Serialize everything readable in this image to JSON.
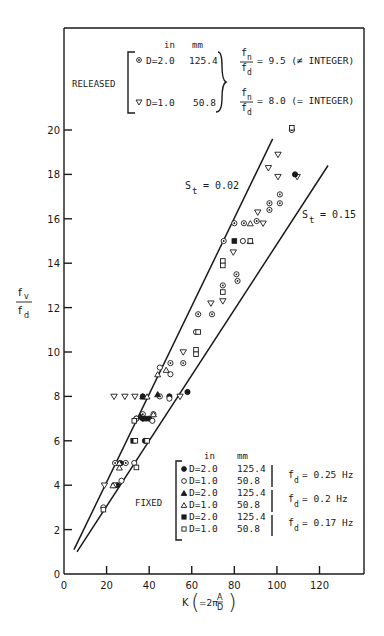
{
  "chart_data": {
    "type": "scatter",
    "title": "",
    "xlabel": "K (=2πA/D)",
    "ylabel": "f_v / f_d",
    "xlim": [
      0,
      141
    ],
    "ylim": [
      0,
      20.9
    ],
    "xticks": [
      0,
      20,
      40,
      60,
      80,
      100,
      120
    ],
    "yticks": [
      0,
      2,
      4,
      6,
      8,
      10,
      12,
      14,
      16,
      18,
      20
    ],
    "grid": false,
    "lines": [
      {
        "name": "St = 0.02",
        "label": "S_t = 0.02",
        "x": [
          4.7,
          98
        ],
        "y": [
          1.1,
          19.6
        ]
      },
      {
        "name": "St = 0.15",
        "label": "S_t = 0.15",
        "x": [
          6.1,
          124
        ],
        "y": [
          1.0,
          18.4
        ]
      }
    ],
    "series": [
      {
        "name": "Released D=2.0 in (125.4 mm), fn/fd=9.5",
        "marker": "circle-dot",
        "points": [
          [
            107,
            20
          ],
          [
            101.4,
            17.1
          ],
          [
            96.5,
            16.7
          ],
          [
            96.5,
            16.4
          ],
          [
            101.4,
            16.7
          ],
          [
            80,
            15.8
          ],
          [
            84.5,
            15.8
          ],
          [
            90.5,
            15.9
          ],
          [
            75,
            15
          ],
          [
            81,
            13.5
          ],
          [
            81.5,
            13.2
          ],
          [
            74.6,
            13
          ],
          [
            63,
            11.7
          ],
          [
            69.5,
            11.7
          ],
          [
            50,
            9.5
          ],
          [
            56,
            9.5
          ],
          [
            24,
            5
          ],
          [
            29,
            5
          ],
          [
            34,
            7
          ],
          [
            37,
            7.2
          ],
          [
            42,
            7.2
          ]
        ]
      },
      {
        "name": "Released D=1.0 in (50.8 mm), fn/fd=8.0",
        "marker": "triangle-down",
        "points": [
          [
            100.5,
            18.9
          ],
          [
            96,
            18.3
          ],
          [
            100.5,
            17.9
          ],
          [
            109.5,
            17.9
          ],
          [
            91,
            16.3
          ],
          [
            93.5,
            15.8
          ],
          [
            79.5,
            14.5
          ],
          [
            69,
            12.2
          ],
          [
            74.6,
            12.3
          ],
          [
            56,
            10
          ],
          [
            54.5,
            8
          ],
          [
            23.5,
            8
          ],
          [
            28.6,
            8
          ],
          [
            33.3,
            8
          ],
          [
            19,
            4
          ]
        ]
      },
      {
        "name": "Fixed D=2.0 in, fd=0.25 Hz",
        "marker": "circle-filled",
        "points": [
          [
            108.5,
            18
          ],
          [
            58,
            8.2
          ],
          [
            49.5,
            8
          ],
          [
            37,
            8
          ],
          [
            37,
            7
          ],
          [
            38,
            6
          ],
          [
            25,
            4
          ],
          [
            26.5,
            5
          ],
          [
            40,
            7
          ]
        ]
      },
      {
        "name": "Fixed D=1.0 in, fd=0.25 Hz",
        "marker": "circle-open",
        "points": [
          [
            84,
            15
          ],
          [
            62,
            10.9
          ],
          [
            50,
            9
          ],
          [
            45,
            9.3
          ],
          [
            45,
            8
          ],
          [
            49.5,
            7.9
          ],
          [
            34,
            7
          ],
          [
            41.5,
            6.9
          ],
          [
            33,
            5
          ],
          [
            23.5,
            4
          ],
          [
            27,
            4.2
          ],
          [
            18.5,
            3
          ]
        ]
      },
      {
        "name": "Fixed D=2.0 in, fd=0.2 Hz",
        "marker": "triangle-filled",
        "points": [
          [
            37,
            8
          ],
          [
            44,
            8.1
          ],
          [
            36,
            7.1
          ]
        ]
      },
      {
        "name": "Fixed D=1.0 in, fd=0.2 Hz",
        "marker": "triangle-open",
        "points": [
          [
            87.5,
            15.8
          ],
          [
            87.5,
            15
          ],
          [
            44,
            9
          ],
          [
            48,
            9.2
          ],
          [
            39,
            8
          ],
          [
            42,
            7.2
          ],
          [
            26,
            5
          ],
          [
            26,
            4.8
          ],
          [
            23,
            4
          ]
        ]
      },
      {
        "name": "Fixed D=2.0 in, fd=0.17 Hz",
        "marker": "square-filled",
        "points": [
          [
            80,
            15
          ],
          [
            32.5,
            6
          ],
          [
            38,
            7
          ]
        ]
      },
      {
        "name": "Fixed D=1.0 in, fd=0.17 Hz",
        "marker": "square-open",
        "points": [
          [
            107,
            20.1
          ],
          [
            87.5,
            15
          ],
          [
            74.6,
            14.1
          ],
          [
            74.6,
            13.9
          ],
          [
            74.6,
            12.7
          ],
          [
            63,
            10.9
          ],
          [
            62,
            10.1
          ],
          [
            62,
            9.9
          ],
          [
            33,
            6.9
          ],
          [
            39,
            6
          ],
          [
            33.5,
            6
          ],
          [
            34,
            4.8
          ],
          [
            18.5,
            2.9
          ]
        ]
      }
    ],
    "annotations": [
      "S_t = 0.02",
      "S_t = 0.15",
      "RELEASED",
      "FIXED"
    ]
  },
  "axes": {
    "xlabel_prefix": "K",
    "xlabel_eq": "=2π",
    "xlabel_num": "A",
    "xlabel_den": "D",
    "ylabel_num": "f",
    "ylabel_num_sub": "v",
    "ylabel_den": "f",
    "ylabel_den_sub": "d",
    "xtick_labels": [
      "0",
      "20",
      "40",
      "60",
      "80",
      "100",
      "120"
    ],
    "ytick_labels": [
      "0",
      "2",
      "4",
      "6",
      "8",
      "10",
      "12",
      "14",
      "16",
      "18",
      "20"
    ]
  },
  "lines_labels": {
    "st002_s": "S",
    "st002_sub": "t",
    "st002_val": "= 0.02",
    "st015_s": "S",
    "st015_sub": "t",
    "st015_val": "= 0.15"
  },
  "legend_released": {
    "title": "RELEASED",
    "col_in": "in",
    "col_mm": "mm",
    "rows": [
      {
        "marker": "circle-dot",
        "text": "D=2.0",
        "mm": "125.4"
      },
      {
        "marker": "triangle-down",
        "text": "D=1.0",
        "mm": "50.8"
      }
    ],
    "ratios": [
      {
        "num": "f",
        "num_sub": "n",
        "den": "f",
        "den_sub": "d",
        "value": "= 9.5 (≠ INTEGER)"
      },
      {
        "num": "f",
        "num_sub": "n",
        "den": "f",
        "den_sub": "d",
        "value": "= 8.0 (= INTEGER)"
      }
    ]
  },
  "legend_fixed": {
    "title": "FIXED",
    "col_in": "in",
    "col_mm": "mm",
    "rows": [
      {
        "marker": "circle-filled",
        "text": "D=2.0",
        "mm": "125.4"
      },
      {
        "marker": "circle-open",
        "text": "D=1.0",
        "mm": "50.8"
      },
      {
        "marker": "triangle-filled",
        "text": "D=2.0",
        "mm": "125.4"
      },
      {
        "marker": "triangle-open",
        "text": "D=1.0",
        "mm": "50.8"
      },
      {
        "marker": "square-filled",
        "text": "D=2.0",
        "mm": "125.4"
      },
      {
        "marker": "square-open",
        "text": "D=1.0",
        "mm": "50.8"
      }
    ],
    "freqs": [
      {
        "f": "f",
        "sub": "d",
        "value": "= 0.25 Hz"
      },
      {
        "f": "f",
        "sub": "d",
        "value": "= 0.2 Hz"
      },
      {
        "f": "f",
        "sub": "d",
        "value": "= 0.17 Hz"
      }
    ]
  }
}
